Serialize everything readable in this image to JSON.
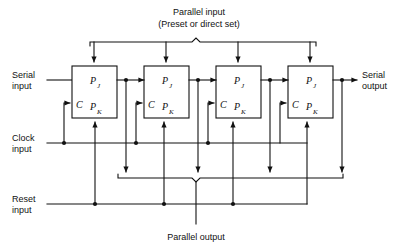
{
  "diagram": {
    "labels": {
      "parallel_input_line1": "Parallel input",
      "parallel_input_line2": "(Preset or direct set)",
      "serial_input_line1": "Serial",
      "serial_input_line2": "input",
      "clock_input_line1": "Clock",
      "clock_input_line2": "input",
      "reset_input_line1": "Reset",
      "reset_input_line2": "input",
      "serial_output_line1": "Serial",
      "serial_output_line2": "output",
      "parallel_output": "Parallel output"
    },
    "flipflops": [
      {
        "id": "ff1",
        "pj": "P",
        "pj_sub": "J",
        "c": "C",
        "pk": "P",
        "pk_sub": "K"
      },
      {
        "id": "ff2",
        "pj": "P",
        "pj_sub": "J",
        "c": "C",
        "pk": "P",
        "pk_sub": "K"
      },
      {
        "id": "ff3",
        "pj": "P",
        "pj_sub": "J",
        "c": "C",
        "pk": "P",
        "pk_sub": "K"
      },
      {
        "id": "ff4",
        "pj": "P",
        "pj_sub": "J",
        "c": "C",
        "pk": "P",
        "pk_sub": "K"
      }
    ],
    "colors": {
      "line": "#111111",
      "background": "#ffffff",
      "box_fill": "#ffffff",
      "text": "#111111"
    },
    "geometry": {
      "stage_count": 4,
      "box_width": 45,
      "box_height": 52,
      "box_pitch": 72,
      "box_top": 66,
      "box_left_first": 72,
      "clock_line_y": 143,
      "reset_line_y": 204,
      "serial_line_y": 80,
      "parallel_input_brace_y": 41,
      "parallel_output_brace_y": 178
    }
  }
}
